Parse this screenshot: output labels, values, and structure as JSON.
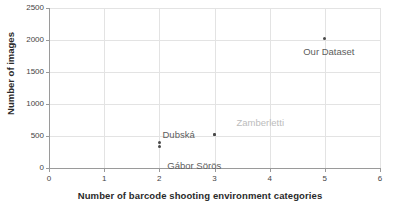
{
  "chart_data": {
    "type": "scatter",
    "title": "",
    "xlabel": "Number of barcode shooting environment categories",
    "ylabel": "Number of images",
    "xlim": [
      0,
      6
    ],
    "ylim": [
      0,
      2500
    ],
    "xticks": [
      "0",
      "1",
      "2",
      "3",
      "4",
      "5",
      "6"
    ],
    "yticks": [
      "0",
      "500",
      "1000",
      "1500",
      "2000",
      "2500"
    ],
    "grid": true,
    "legend": "none",
    "points": [
      {
        "label": "Our Dataset",
        "x": 5,
        "y": 2020,
        "label_dx": 4,
        "label_dy": 13,
        "label_anchor": "center",
        "style": "dark"
      },
      {
        "label": "Zamberletti",
        "x": 3,
        "y": 520,
        "label_dx": 22,
        "label_dy": -12,
        "label_anchor": "left",
        "style": "light"
      },
      {
        "label": "Dubská",
        "x": 3,
        "y": 520,
        "label_dx": -52,
        "label_dy": 0,
        "label_anchor": "left",
        "style": "dark"
      },
      {
        "label": "Gábor Sörös",
        "x": 2,
        "y": 400,
        "label_dx": 8,
        "label_dy": 24,
        "label_anchor": "left",
        "style": "dark"
      },
      {
        "label": "",
        "x": 2,
        "y": 330,
        "label_dx": 0,
        "label_dy": 0,
        "label_anchor": "left",
        "style": "dark"
      }
    ],
    "colors": {
      "point": "#4a4a4a",
      "label": "#5d5d5d",
      "label_light": "#bcbcbc",
      "grid": "#e3e3e3",
      "axis": "#9a9a9a",
      "background": "#ffffff"
    }
  }
}
